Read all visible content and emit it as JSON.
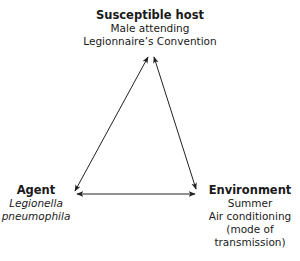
{
  "diagram": {
    "type": "epidemiologic-triangle",
    "nodes": {
      "host": {
        "title": "Susceptible host",
        "lines": [
          "Male attending",
          "Legionnaire’s Convention"
        ]
      },
      "agent": {
        "title": "Agent",
        "lines": [
          "Legionella",
          "pneumophila"
        ]
      },
      "environment": {
        "title": "Environment",
        "lines": [
          "Summer",
          "Air conditioning",
          "(mode of",
          "transmission)"
        ]
      }
    },
    "edges": [
      {
        "from": "host",
        "to": "agent",
        "style": "double-headed-arrow"
      },
      {
        "from": "host",
        "to": "environment",
        "style": "double-headed-arrow"
      },
      {
        "from": "agent",
        "to": "environment",
        "style": "double-headed-arrow"
      }
    ],
    "colors": {
      "text": "#1a1a1a",
      "arrow": "#222222",
      "background": "#ffffff"
    }
  }
}
